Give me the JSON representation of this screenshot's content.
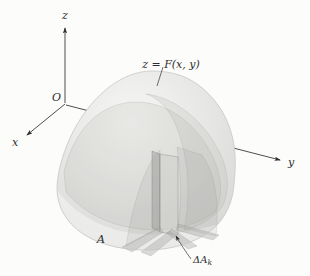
{
  "figure_labels": {
    "axis_z": "z",
    "axis_x": "x",
    "axis_y": "y",
    "origin": "O",
    "surface": "z = F(x, y)",
    "region": "A",
    "element_main": "ΔA",
    "element_sub": "k"
  },
  "colors": {
    "background": "#fcfcfb",
    "dome_highlight": "#f6f6f4",
    "dome_mid": "#e8e8e6",
    "dome_shadow": "#d5d5d3",
    "outline": "#c6c6c4",
    "axis": "#3a3a3a",
    "text": "#2e2e2e"
  }
}
